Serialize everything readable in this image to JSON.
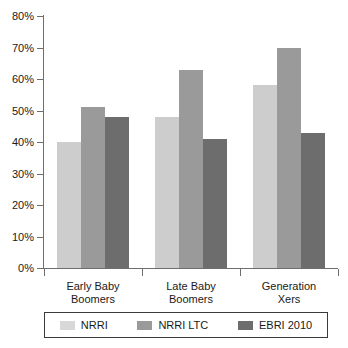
{
  "chart_data": {
    "type": "bar",
    "title": "",
    "subtitle": "",
    "xlabel": "",
    "ylabel": "",
    "ylim": [
      0,
      80
    ],
    "ytick_labels": [
      "0%",
      "10%",
      "20%",
      "30%",
      "40%",
      "50%",
      "60%",
      "70%",
      "80%"
    ],
    "ytick_values": [
      0,
      10,
      20,
      30,
      40,
      50,
      60,
      70,
      80
    ],
    "grid": false,
    "legend_position": "bottom",
    "categories": [
      "Early Baby Boomers",
      "Late Baby Boomers",
      "Generation Xers"
    ],
    "category_lines": [
      [
        "Early Baby",
        "Boomers"
      ],
      [
        "Late Baby",
        "Boomers"
      ],
      [
        "Generation",
        "Xers"
      ]
    ],
    "series": [
      {
        "name": "NRRI",
        "color": "#cdcdcd",
        "values": [
          40,
          48,
          58
        ]
      },
      {
        "name": "NRRI LTC",
        "color": "#9a9a9a",
        "values": [
          51,
          63,
          70
        ]
      },
      {
        "name": "EBRI 2010",
        "color": "#6d6d6d",
        "values": [
          48,
          41,
          43
        ]
      }
    ]
  },
  "legend": {
    "items": [
      {
        "label": "NRRI"
      },
      {
        "label": "NRRI LTC"
      },
      {
        "label": "EBRI 2010"
      }
    ]
  },
  "colors": {
    "axis": "#6e6e6e",
    "text": "#1a1a1a",
    "background": "#ffffff",
    "series_1": "#cdcdcd",
    "series_2": "#9a9a9a",
    "series_3": "#6d6d6d"
  }
}
